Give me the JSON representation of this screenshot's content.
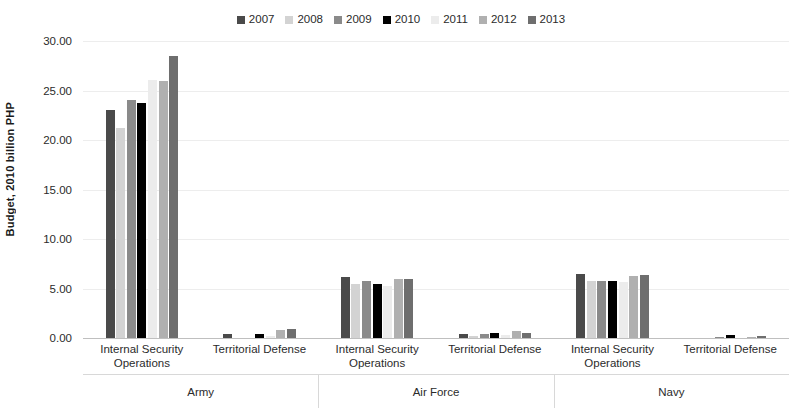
{
  "chart_data": {
    "type": "bar",
    "title": "",
    "subtitle": "",
    "xlabel": "",
    "ylabel": "Budget, 2010 billion PHP",
    "ylim": [
      0,
      30
    ],
    "ytick_values": [
      0,
      5,
      10,
      15,
      20,
      25,
      30
    ],
    "ytick_labels": [
      "0.00",
      "5.00",
      "10.00",
      "15.00",
      "20.00",
      "25.00",
      "30.00"
    ],
    "grid": true,
    "legend_position": "top-center",
    "legend": [
      "2007",
      "2008",
      "2009",
      "2010",
      "2011",
      "2012",
      "2013"
    ],
    "series": [
      {
        "name": "2007",
        "color": "#4a4a4a",
        "values": [
          23.0,
          0.4,
          6.2,
          0.4,
          6.5,
          0.05
        ]
      },
      {
        "name": "2008",
        "color": "#d3d3d3",
        "values": [
          21.2,
          0.05,
          5.5,
          0.25,
          5.8,
          0.05
        ]
      },
      {
        "name": "2009",
        "color": "#8a8a8a",
        "values": [
          24.0,
          0.05,
          5.8,
          0.4,
          5.8,
          0.15
        ]
      },
      {
        "name": "2010",
        "color": "#000000",
        "values": [
          23.7,
          0.4,
          5.5,
          0.5,
          5.8,
          0.3
        ]
      },
      {
        "name": "2011",
        "color": "#ececec",
        "values": [
          26.1,
          0.25,
          5.3,
          0.3,
          5.7,
          0.05
        ]
      },
      {
        "name": "2012",
        "color": "#b0b0b0",
        "values": [
          26.0,
          0.8,
          6.0,
          0.7,
          6.3,
          0.15
        ]
      },
      {
        "name": "2013",
        "color": "#6e6e6e",
        "values": [
          28.5,
          0.95,
          6.0,
          0.5,
          6.4,
          0.2
        ]
      }
    ],
    "categories": [
      "Internal Security Operations",
      "Territorial Defense",
      "Internal Security Operations",
      "Territorial Defense",
      "Internal Security Operations",
      "Territorial Defense"
    ],
    "category_lines": [
      [
        "Internal Security",
        "Operations"
      ],
      [
        "Territorial Defense"
      ],
      [
        "Internal Security",
        "Operations"
      ],
      [
        "Territorial Defense"
      ],
      [
        "Internal Security",
        "Operations"
      ],
      [
        "Territorial Defense"
      ]
    ],
    "groups": [
      {
        "label": "Army",
        "categories": [
          0,
          1
        ]
      },
      {
        "label": "Air Force",
        "categories": [
          2,
          3
        ]
      },
      {
        "label": "Navy",
        "categories": [
          4,
          5
        ]
      }
    ]
  },
  "colors": {
    "background": "#ffffff",
    "gridline": "#ededed",
    "axis": "#bfbfbf",
    "text": "#2b2b2b"
  }
}
